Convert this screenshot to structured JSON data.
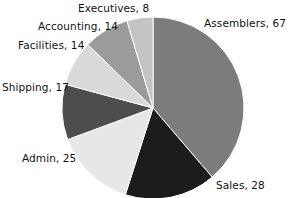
{
  "chart_data": {
    "type": "pie",
    "title": "",
    "subtitle": "",
    "xlabel": "",
    "ylabel": "",
    "legend_position": "none",
    "label_format": "name, value",
    "total": 173,
    "start_angle_deg": 0,
    "direction": "clockwise",
    "categories": [
      "Assemblers",
      "Sales",
      "Admin",
      "Shipping",
      "Facilities",
      "Accounting",
      "Executives"
    ],
    "values": [
      67,
      28,
      25,
      17,
      14,
      14,
      8
    ],
    "colors": [
      "#7c7c7c",
      "#1c1c1c",
      "#e7e7e7",
      "#4d4d4d",
      "#d9d9d9",
      "#9b9b9b",
      "#c4c4c4"
    ],
    "slices": [
      {
        "name": "Assemblers",
        "value": 67,
        "label": "Assemblers, 67",
        "color": "#7c7c7c",
        "percent": 38.7
      },
      {
        "name": "Sales",
        "value": 28,
        "label": "Sales, 28",
        "color": "#1c1c1c",
        "percent": 16.2
      },
      {
        "name": "Admin",
        "value": 25,
        "label": "Admin, 25",
        "color": "#e7e7e7",
        "percent": 14.5
      },
      {
        "name": "Shipping",
        "value": 17,
        "label": "Shipping, 17",
        "color": "#4d4d4d",
        "percent": 9.8
      },
      {
        "name": "Facilities",
        "value": 14,
        "label": "Facilities, 14",
        "color": "#d9d9d9",
        "percent": 8.1
      },
      {
        "name": "Accounting",
        "value": 14,
        "label": "Accounting, 14",
        "color": "#9b9b9b",
        "percent": 8.1
      },
      {
        "name": "Executives",
        "value": 8,
        "label": "Executives, 8",
        "color": "#c4c4c4",
        "percent": 4.6
      }
    ]
  },
  "labels": {
    "assemblers": "Assemblers, 67",
    "sales": "Sales, 28",
    "admin": "Admin, 25",
    "shipping": "Shipping, 17",
    "facilities": "Facilities, 14",
    "accounting": "Accounting, 14",
    "executives": "Executives, 8"
  },
  "geometry": {
    "center_x": 153,
    "center_y": 108,
    "radius": 91
  },
  "style": {
    "background": "#ffffff",
    "label_color": "#111111",
    "slice_border": "#ffffff"
  }
}
